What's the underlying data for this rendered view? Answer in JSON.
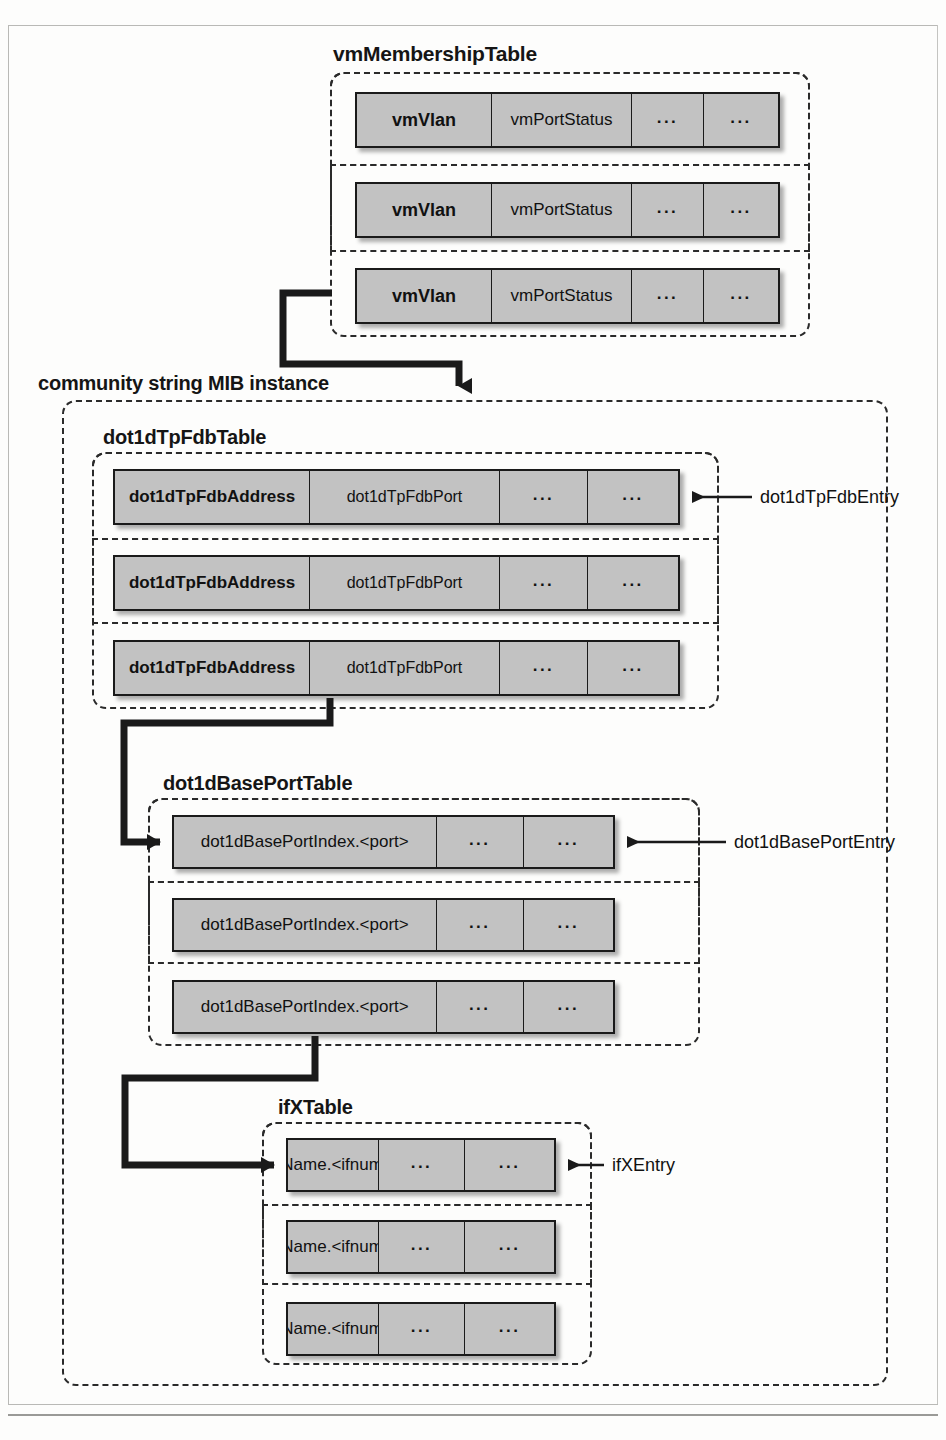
{
  "diagram": {
    "colors": {
      "row_fill": "#c2c2c2",
      "row_border": "#1a1a1a",
      "dash_border": "#2a2a2a",
      "text": "#111111",
      "page_bg": "#fdfdfc"
    },
    "groups": [
      {
        "id": "vmMembershipTable",
        "label": "vmMembershipTable",
        "rows": [
          {
            "cells": [
              "vmVlan",
              "vmPortStatus",
              "...",
              "..."
            ]
          },
          {
            "cells": [
              "vmVlan",
              "vmPortStatus",
              "...",
              "..."
            ]
          },
          {
            "cells": [
              "vmVlan",
              "vmPortStatus",
              "...",
              "..."
            ]
          }
        ]
      },
      {
        "id": "communityStringMibInstance",
        "label": "community string MIB instance",
        "groups": [
          {
            "id": "dot1dTpFdbTable",
            "label": "dot1dTpFdbTable",
            "entry_callout": "dot1dTpFdbEntry",
            "rows": [
              {
                "cells": [
                  "dot1dTpFdbAddress",
                  "dot1dTpFdbPort",
                  "...",
                  "..."
                ]
              },
              {
                "cells": [
                  "dot1dTpFdbAddress",
                  "dot1dTpFdbPort",
                  "...",
                  "..."
                ]
              },
              {
                "cells": [
                  "dot1dTpFdbAddress",
                  "dot1dTpFdbPort",
                  "...",
                  "..."
                ]
              }
            ]
          },
          {
            "id": "dot1dBasePortTable",
            "label": "dot1dBasePortTable",
            "entry_callout": "dot1dBasePortEntry",
            "rows": [
              {
                "cells": [
                  "dot1dBasePortIndex.<port>",
                  "...",
                  "..."
                ]
              },
              {
                "cells": [
                  "dot1dBasePortIndex.<port>",
                  "...",
                  "..."
                ]
              },
              {
                "cells": [
                  "dot1dBasePortIndex.<port>",
                  "...",
                  "..."
                ]
              }
            ]
          },
          {
            "id": "ifXTable",
            "label": "ifXTable",
            "entry_callout": "ifXEntry",
            "rows": [
              {
                "cells": [
                  "ifName.<ifnum>",
                  "...",
                  "..."
                ]
              },
              {
                "cells": [
                  "ifName.<ifnum>",
                  "...",
                  "..."
                ]
              },
              {
                "cells": [
                  "ifName.<ifnum>",
                  "...",
                  "..."
                ]
              }
            ]
          }
        ]
      }
    ]
  }
}
